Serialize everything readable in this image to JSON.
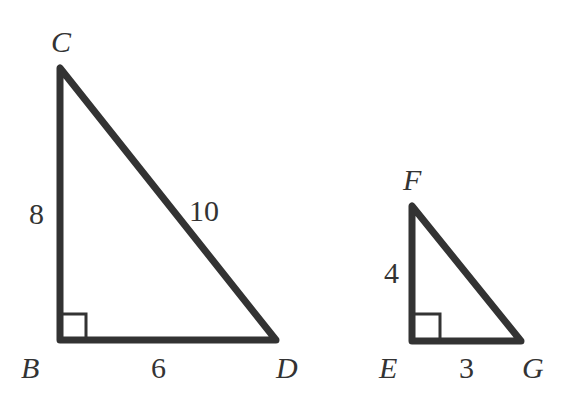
{
  "diagram": {
    "stroke_color": "#333333",
    "triangles": [
      {
        "name": "large",
        "vertices": {
          "C": {
            "label": "C",
            "x": 60,
            "y": 68
          },
          "B": {
            "label": "B",
            "x": 60,
            "y": 340
          },
          "D": {
            "label": "D",
            "x": 276,
            "y": 340
          }
        },
        "right_angle_at": "B",
        "sides": {
          "CB": "8",
          "BD": "6",
          "CD": "10"
        }
      },
      {
        "name": "small",
        "vertices": {
          "F": {
            "label": "F",
            "x": 412,
            "y": 206
          },
          "E": {
            "label": "E",
            "x": 412,
            "y": 341
          },
          "G": {
            "label": "G",
            "x": 521,
            "y": 341
          }
        },
        "right_angle_at": "E",
        "sides": {
          "FE": "4",
          "EG": "3"
        }
      }
    ]
  }
}
